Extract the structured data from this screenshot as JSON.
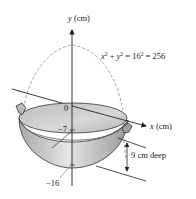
{
  "figure": {
    "type": "wok cross-section diagram",
    "y_axis_label": "y (cm)",
    "x_axis_label": "x (cm)",
    "equation": {
      "lhs_x": "x",
      "lhs_y": "y",
      "base": "16",
      "exp": "2",
      "result": "256",
      "full_text": "x² + y² = 16² = 256"
    },
    "tick_labels": {
      "origin": "0",
      "water_level": "−7",
      "bottom": "−16"
    },
    "depth_label": "9 cm deep",
    "colors": {
      "bowl_fill": "#c8c8c8",
      "bowl_inner": "#e0e0e0",
      "line": "#222222",
      "dashed": "#888888"
    }
  }
}
